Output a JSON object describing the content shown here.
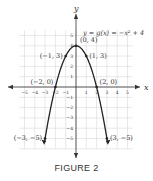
{
  "chart_data": {
    "type": "line",
    "title": "",
    "equation_label": "y = g(x) = −x² + 4",
    "xlabel": "x",
    "ylabel": "y",
    "xlim": [
      -5.5,
      5.5
    ],
    "ylim": [
      -6,
      5.5
    ],
    "grid": true,
    "x_ticks": [
      -5,
      -4,
      -3,
      -2,
      -1,
      1,
      2,
      3,
      4,
      5
    ],
    "y_ticks": [
      -5,
      -4,
      -3,
      -2,
      -1,
      1,
      2,
      3,
      4,
      5
    ],
    "series": [
      {
        "name": "g(x) = -x^2 + 4",
        "x": [
          -3,
          -2,
          -1,
          0,
          1,
          2,
          3
        ],
        "y": [
          -5,
          0,
          3,
          4,
          3,
          0,
          -5
        ]
      }
    ],
    "labeled_points": [
      {
        "label": "(0, 4)",
        "x": 0,
        "y": 4
      },
      {
        "label": "(−1, 3)",
        "x": -1,
        "y": 3
      },
      {
        "label": "(1, 3)",
        "x": 1,
        "y": 3
      },
      {
        "label": "(−2, 0)",
        "x": -2,
        "y": 0
      },
      {
        "label": "(2, 0)",
        "x": 2,
        "y": 0
      },
      {
        "label": "(−3, −5)",
        "x": -3,
        "y": -5
      },
      {
        "label": "(3, −5)",
        "x": 3,
        "y": -5
      }
    ]
  },
  "caption": "FIGURE 2",
  "colors": {
    "curve": "#222222",
    "grid": "#d8d8d8",
    "axis": "#333333",
    "text": "#333333"
  }
}
